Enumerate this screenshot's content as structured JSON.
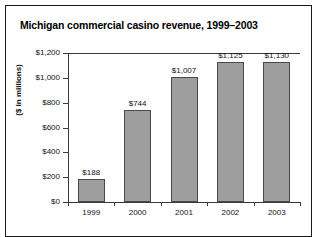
{
  "frame": {
    "border_color": "#1a1a1a"
  },
  "chart_data": {
    "type": "bar",
    "title": "Michigan commercial casino revenue, 1999–2003",
    "xlabel": "",
    "ylabel": "($ in millions)",
    "categories": [
      "1999",
      "2000",
      "2001",
      "2002",
      "2003"
    ],
    "values": [
      188,
      744,
      1007,
      1125,
      1130
    ],
    "value_labels": [
      "$188",
      "$744",
      "$1,007",
      "$1,125",
      "$1,130"
    ],
    "ylim": [
      0,
      1200
    ],
    "ytick_values": [
      0,
      200,
      400,
      600,
      800,
      1000,
      1200
    ],
    "ytick_labels": [
      "$0",
      "$200",
      "$400",
      "$600",
      "$800",
      "$1,000",
      "$1,200"
    ],
    "grid": false,
    "legend": null,
    "bar_color": "#9e9e9e",
    "bar_edge_color": "#4a4a4a",
    "axis_color": "#3a3a3a"
  }
}
